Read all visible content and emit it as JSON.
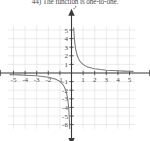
{
  "question": {
    "number": "44)",
    "text": "44)  The function is one-to-one."
  },
  "chart_data": {
    "type": "line",
    "title": "",
    "subtitle": "",
    "function": "y = 1/x",
    "xlabel": "x",
    "ylabel": "y",
    "xlim": [
      -5.8,
      5.8
    ],
    "ylim": [
      -6.8,
      5.8
    ],
    "xticks": [
      -5,
      -4,
      -3,
      -2,
      -1,
      1,
      2,
      3,
      4,
      5
    ],
    "yticks": [
      5,
      4,
      3,
      2,
      1,
      -1,
      -2,
      -3,
      -4,
      -5,
      -6
    ],
    "xtick_labels": [
      "-5",
      "-4",
      "-3",
      "-2",
      "-1",
      "1",
      "2",
      "3",
      "4",
      "5"
    ],
    "ytick_labels": [
      "5",
      "4",
      "3",
      "2",
      "1",
      "-1",
      "-2",
      "-3",
      "-4",
      "-5",
      "-6"
    ],
    "grid": true,
    "grid_color": "#d9d9d9",
    "axis_color": "#3a3a3a",
    "curve_color": "#7a7a7a",
    "legend": "none",
    "axis_arrows": [
      "left",
      "right",
      "up",
      "down"
    ],
    "series": [
      {
        "name": "branch-positive",
        "comment": "x > 0 branch of y = 1/x",
        "x": [
          0.19,
          0.21,
          0.23,
          0.26,
          0.3,
          0.35,
          0.4,
          0.5,
          0.6,
          0.7,
          0.8,
          0.9,
          1.0,
          1.2,
          1.4,
          1.6,
          1.8,
          2.0,
          2.5,
          3.0,
          3.5,
          4.0,
          4.5,
          5.0,
          5.3
        ],
        "y": [
          5.26,
          4.76,
          4.35,
          3.85,
          3.33,
          2.86,
          2.5,
          2.0,
          1.67,
          1.43,
          1.25,
          1.11,
          1.0,
          0.83,
          0.71,
          0.63,
          0.56,
          0.5,
          0.4,
          0.33,
          0.29,
          0.25,
          0.22,
          0.2,
          0.19
        ]
      },
      {
        "name": "branch-negative",
        "comment": "x < 0 branch of y = 1/x",
        "x": [
          -5.3,
          -5.0,
          -4.5,
          -4.0,
          -3.5,
          -3.0,
          -2.5,
          -2.0,
          -1.8,
          -1.6,
          -1.4,
          -1.2,
          -1.0,
          -0.9,
          -0.8,
          -0.7,
          -0.6,
          -0.5,
          -0.4,
          -0.35,
          -0.3,
          -0.26,
          -0.23,
          -0.21,
          -0.17,
          -0.155
        ],
        "y": [
          -0.19,
          -0.2,
          -0.22,
          -0.25,
          -0.29,
          -0.33,
          -0.4,
          -0.5,
          -0.56,
          -0.63,
          -0.71,
          -0.83,
          -1.0,
          -1.11,
          -1.25,
          -1.43,
          -1.67,
          -2.0,
          -2.5,
          -2.86,
          -3.33,
          -3.85,
          -4.35,
          -4.76,
          -5.88,
          -6.45
        ]
      }
    ]
  },
  "labels": {
    "x_axis_label": "x",
    "y_axis_label": "y"
  }
}
